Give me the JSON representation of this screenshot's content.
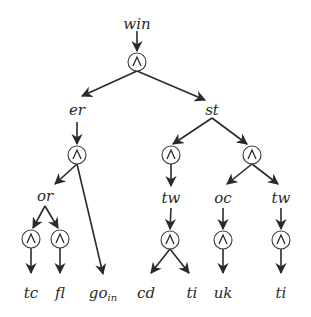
{
  "diagram": {
    "title": "",
    "type": "and-tree",
    "stroke_color": "#2a2a2a",
    "and_symbol": "∧",
    "nodes": [
      {
        "id": "win",
        "kind": "label",
        "text": "win",
        "x": 137,
        "y": 24
      },
      {
        "id": "a0",
        "kind": "and",
        "x": 137,
        "y": 62
      },
      {
        "id": "er",
        "kind": "label",
        "text": "er",
        "x": 77,
        "y": 110
      },
      {
        "id": "st",
        "kind": "label",
        "text": "st",
        "x": 212,
        "y": 110
      },
      {
        "id": "a1",
        "kind": "and",
        "x": 77,
        "y": 155
      },
      {
        "id": "a2",
        "kind": "and",
        "x": 171,
        "y": 155
      },
      {
        "id": "a3",
        "kind": "and",
        "x": 252,
        "y": 155
      },
      {
        "id": "or",
        "kind": "label",
        "text": "or",
        "x": 45,
        "y": 196
      },
      {
        "id": "tw1",
        "kind": "label",
        "text": "tw",
        "x": 171,
        "y": 198
      },
      {
        "id": "oc",
        "kind": "label",
        "text": "oc",
        "x": 223,
        "y": 198
      },
      {
        "id": "tw2",
        "kind": "label",
        "text": "tw",
        "x": 281,
        "y": 198
      },
      {
        "id": "a4",
        "kind": "and",
        "x": 31,
        "y": 239
      },
      {
        "id": "a5",
        "kind": "and",
        "x": 60,
        "y": 239
      },
      {
        "id": "a6",
        "kind": "and",
        "x": 170,
        "y": 240
      },
      {
        "id": "a7",
        "kind": "and",
        "x": 223,
        "y": 240
      },
      {
        "id": "a8",
        "kind": "and",
        "x": 281,
        "y": 240
      },
      {
        "id": "tc",
        "kind": "label",
        "text": "tc",
        "x": 31,
        "y": 293
      },
      {
        "id": "fl",
        "kind": "label",
        "text": "fl",
        "x": 60,
        "y": 293
      },
      {
        "id": "goin",
        "kind": "label",
        "text": "go",
        "subscript": "in",
        "x": 103,
        "y": 293
      },
      {
        "id": "cd",
        "kind": "label",
        "text": "cd",
        "x": 146,
        "y": 293
      },
      {
        "id": "ti1",
        "kind": "label",
        "text": "ti",
        "x": 192,
        "y": 293
      },
      {
        "id": "uk",
        "kind": "label",
        "text": "uk",
        "x": 223,
        "y": 293
      },
      {
        "id": "ti2",
        "kind": "label",
        "text": "ti",
        "x": 281,
        "y": 293
      }
    ],
    "edges": [
      {
        "from": [
          137,
          31
        ],
        "to": [
          137,
          51
        ]
      },
      {
        "from": [
          137,
          71
        ],
        "to": [
          82,
          96
        ]
      },
      {
        "from": [
          137,
          71
        ],
        "to": [
          205,
          100
        ]
      },
      {
        "from": [
          77,
          122
        ],
        "to": [
          77,
          144
        ]
      },
      {
        "from": [
          212,
          118
        ],
        "to": [
          173,
          144
        ]
      },
      {
        "from": [
          212,
          118
        ],
        "to": [
          247,
          144
        ]
      },
      {
        "from": [
          77,
          164
        ],
        "to": [
          55,
          184
        ]
      },
      {
        "from": [
          77,
          164
        ],
        "to": [
          103,
          274
        ]
      },
      {
        "from": [
          171,
          164
        ],
        "to": [
          171,
          186
        ]
      },
      {
        "from": [
          252,
          164
        ],
        "to": [
          227,
          184
        ]
      },
      {
        "from": [
          252,
          164
        ],
        "to": [
          278,
          184
        ]
      },
      {
        "from": [
          45,
          206
        ],
        "to": [
          33,
          228
        ]
      },
      {
        "from": [
          45,
          206
        ],
        "to": [
          58,
          228
        ]
      },
      {
        "from": [
          171,
          208
        ],
        "to": [
          170,
          229
        ]
      },
      {
        "from": [
          223,
          208
        ],
        "to": [
          223,
          229
        ]
      },
      {
        "from": [
          281,
          208
        ],
        "to": [
          281,
          229
        ]
      },
      {
        "from": [
          31,
          248
        ],
        "to": [
          31,
          273
        ]
      },
      {
        "from": [
          60,
          248
        ],
        "to": [
          60,
          273
        ]
      },
      {
        "from": [
          170,
          249
        ],
        "to": [
          151,
          273
        ]
      },
      {
        "from": [
          170,
          249
        ],
        "to": [
          189,
          273
        ]
      },
      {
        "from": [
          223,
          249
        ],
        "to": [
          223,
          273
        ]
      },
      {
        "from": [
          281,
          249
        ],
        "to": [
          281,
          273
        ]
      }
    ]
  }
}
